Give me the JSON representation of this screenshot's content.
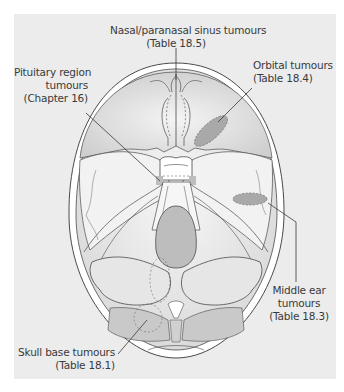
{
  "figure": {
    "type": "anatomical-diagram",
    "colors": {
      "panel_bg": "#ececec",
      "bone": "#ffffff",
      "fossa_fill": "#d9d9d9",
      "tumour_region": "#a9a9a9",
      "outline": "#4a4a4a",
      "text": "#3a3a3a"
    }
  },
  "labels": {
    "nasal": {
      "line1": "Nasal/paranasal sinus tumours",
      "line2": "(Table 18.5)"
    },
    "pituitary": {
      "line1": "Pituitary region",
      "line2": "tumours",
      "line3": "(Chapter 16)"
    },
    "orbital": {
      "line1": "Orbital tumours",
      "line2": "(Table 18.4)"
    },
    "middle_ear": {
      "line1": "Middle ear",
      "line2": "tumours",
      "line3": "(Table 18.3)"
    },
    "skull_base": {
      "line1": "Skull base tumours",
      "line2": "(Table 18.1)"
    }
  }
}
